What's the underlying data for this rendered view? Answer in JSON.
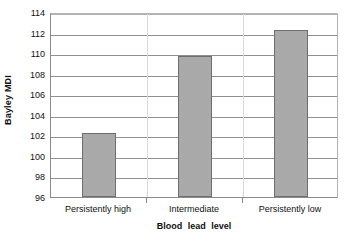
{
  "chart_data": {
    "type": "bar",
    "title": "",
    "xlabel": "Blood  lead  level",
    "ylabel": "Bayley MDI",
    "categories": [
      "Persistently high",
      "Intermediate",
      "Persistently low"
    ],
    "values": [
      102.2,
      109.7,
      112.2
    ],
    "ylim": [
      96,
      114
    ],
    "yticks": [
      96,
      98,
      100,
      102,
      104,
      106,
      108,
      110,
      112,
      114
    ],
    "ytick_labels": [
      "96",
      "98",
      "100",
      "102",
      "104",
      "106",
      "108",
      "110",
      "112",
      "114"
    ],
    "grid": true,
    "legend": false,
    "legend_position": "none",
    "series": [
      {
        "name": "Bayley MDI",
        "values": [
          102.2,
          109.7,
          112.2
        ]
      }
    ],
    "colors": {
      "bar_fill": "#a9a9a9",
      "bar_border": "#6e6e6e",
      "gridline": "#8f8f8f",
      "axis": "#8a8a8a",
      "background": "#ffffff",
      "text": "#111111"
    }
  }
}
